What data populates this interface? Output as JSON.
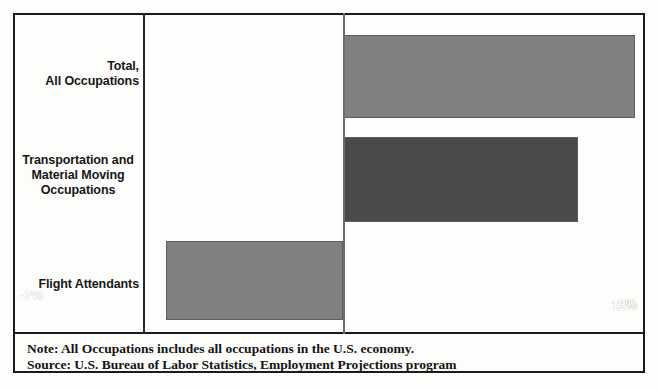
{
  "chart_data": {
    "type": "bar",
    "orientation": "horizontal",
    "title": "",
    "xlabel": "",
    "ylabel": "",
    "categories": [
      "Total,\nAll Occupations",
      "Transportation and\nMaterial Moving\nOccupations",
      "Flight Attendants"
    ],
    "values": [
      11,
      9,
      -7
    ],
    "value_labels": [
      "11%",
      "9%",
      "-7%"
    ],
    "bar_colors": [
      "#808080",
      "#4a4a4a",
      "#808080"
    ],
    "xlim": [
      -7,
      11
    ],
    "zero_line": 0,
    "grid": false,
    "legend": null,
    "units": "percent"
  },
  "categories": {
    "items": [
      {
        "line1": "Total,",
        "line2": "All Occupations",
        "line3": ""
      },
      {
        "line1": "Transportation and",
        "line2": "Material Moving",
        "line3": "Occupations"
      },
      {
        "line1": "Flight Attendants",
        "line2": "",
        "line3": ""
      }
    ]
  },
  "bars": [
    {
      "label": "11%",
      "value": 11
    },
    {
      "label": "9%",
      "value": 9
    },
    {
      "label": "-7%",
      "value": -7
    }
  ],
  "footer": {
    "note": "Note: All Occupations includes all occupations in the U.S. economy.",
    "source": "Source: U.S. Bureau of Labor Statistics, Employment Projections program"
  }
}
